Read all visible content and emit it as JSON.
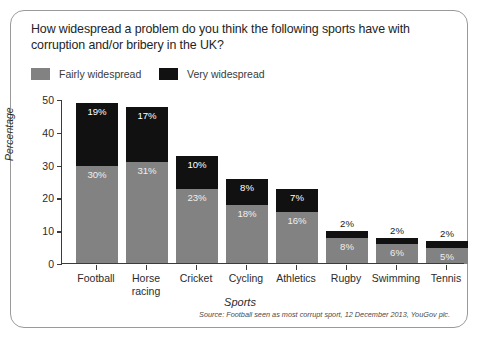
{
  "card": {
    "title": "How widespread a problem do you think the following sports have with corruption and/or bribery in the UK?",
    "source_note": "Source: Football seen as most corrupt sport, 12 December 2013, YouGov plc."
  },
  "legend": {
    "items": [
      {
        "label": "Fairly widespread",
        "color": "#828282"
      },
      {
        "label": "Very widespread",
        "color": "#111111"
      }
    ]
  },
  "chart_data": {
    "type": "bar",
    "stacked": true,
    "title": "How widespread a problem do you think the following sports have with corruption and/or bribery in the UK?",
    "xlabel": "Sports",
    "ylabel": "Percentage",
    "ylim": [
      0,
      50
    ],
    "yticks": [
      0,
      10,
      20,
      30,
      40,
      50
    ],
    "ytick_labels": [
      "0",
      "10",
      "20",
      "30",
      "40",
      "50"
    ],
    "grid": false,
    "legend_position": "top-left",
    "categories": [
      "Football",
      "Horse racing",
      "Cricket",
      "Cycling",
      "Athletics",
      "Rugby",
      "Swimming",
      "Tennis"
    ],
    "category_lines": [
      [
        "Football"
      ],
      [
        "Horse",
        "racing"
      ],
      [
        "Cricket"
      ],
      [
        "Cycling"
      ],
      [
        "Athletics"
      ],
      [
        "Rugby"
      ],
      [
        "Swimming"
      ],
      [
        "Tennis"
      ]
    ],
    "series": [
      {
        "name": "Fairly widespread",
        "color": "#828282",
        "values": [
          30,
          31,
          23,
          18,
          16,
          8,
          6,
          5
        ],
        "data_labels": [
          "30%",
          "31%",
          "23%",
          "18%",
          "16%",
          "8%",
          "6%",
          "5%"
        ]
      },
      {
        "name": "Very widespread",
        "color": "#111111",
        "values": [
          19,
          17,
          10,
          8,
          7,
          2,
          2,
          2
        ],
        "data_labels": [
          "19%",
          "17%",
          "10%",
          "8%",
          "7%",
          "2%",
          "2%",
          "2%"
        ]
      }
    ],
    "totals": [
      49,
      48,
      33,
      26,
      23,
      10,
      8,
      7
    ],
    "source": "Source: Football seen as most corrupt sport, 12 December 2013, YouGov plc."
  }
}
